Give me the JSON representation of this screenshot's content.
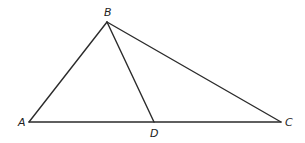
{
  "diagram": {
    "type": "triangle-with-cevian",
    "colors": {
      "background": "#ffffff",
      "stroke": "#2b2b2b",
      "label": "#222222"
    },
    "points": {
      "A": {
        "label": "A",
        "x": 29,
        "y": 122
      },
      "B": {
        "label": "B",
        "x": 107,
        "y": 22
      },
      "C": {
        "label": "C",
        "x": 281,
        "y": 122
      },
      "D": {
        "label": "D",
        "x": 154,
        "y": 122
      }
    },
    "segments": [
      {
        "from": "A",
        "to": "B"
      },
      {
        "from": "B",
        "to": "C"
      },
      {
        "from": "A",
        "to": "C"
      },
      {
        "from": "B",
        "to": "D"
      }
    ],
    "labels": {
      "A": "A",
      "B": "B",
      "C": "C",
      "D": "D"
    }
  }
}
